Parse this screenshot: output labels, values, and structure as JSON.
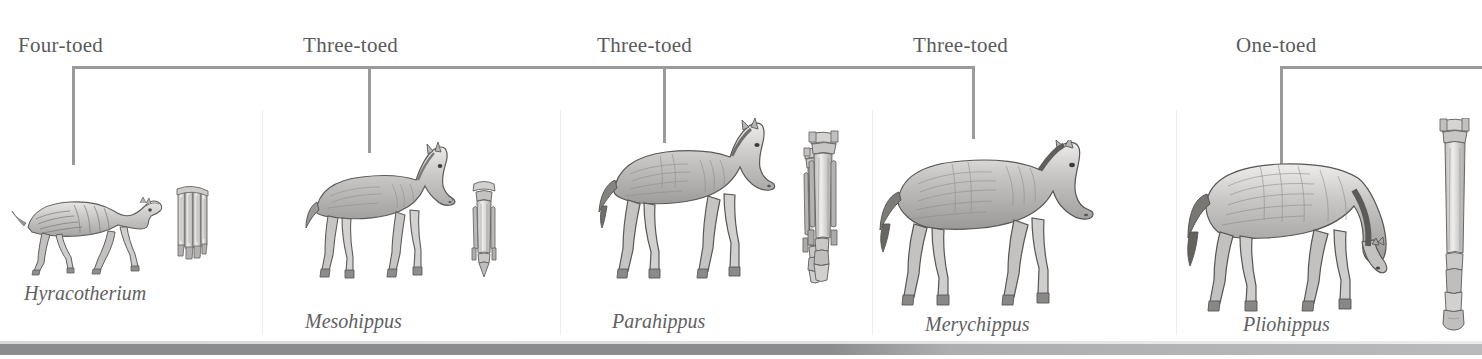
{
  "diagram": {
    "title_alt": "Horse evolution series",
    "background_color": "#ffffff",
    "rule_color": "#9a9a9c",
    "label_color": "#595a5c",
    "name_color": "#606062"
  },
  "toe_labels": [
    {
      "text": "Four-toed",
      "x": 18,
      "y": 33
    },
    {
      "text": "Three-toed",
      "x": 303,
      "y": 33
    },
    {
      "text": "Three-toed",
      "x": 597,
      "y": 33
    },
    {
      "text": "Three-toed",
      "x": 913,
      "y": 33
    },
    {
      "text": "One-toed",
      "x": 1236,
      "y": 33
    }
  ],
  "brackets": [
    {
      "name": "four-toed-bracket",
      "x": 72,
      "width": 903,
      "tick_x": [
        72,
        368,
        663,
        975
      ],
      "tick_bottom": [
        165,
        153,
        143,
        139
      ]
    },
    {
      "name": "one-toed-bracket",
      "x": 1280,
      "width": 202,
      "tick_x": [
        1280
      ],
      "tick_bottom": [
        168
      ]
    }
  ],
  "bracket_rule_y": 66,
  "panel_dividers": [
    262,
    560,
    872,
    1176
  ],
  "species": [
    {
      "name": "Hyracotherium",
      "label_x": 24,
      "label_y": 282,
      "toes": "Four-toed"
    },
    {
      "name": "Mesohippus",
      "label_x": 305,
      "label_y": 315,
      "toes": "Three-toed"
    },
    {
      "name": "Parahippus",
      "label_x": 612,
      "label_y": 315,
      "toes": "Three-toed"
    },
    {
      "name": "Merychippus",
      "label_x": 925,
      "label_y": 318,
      "toes": "Three-toed"
    },
    {
      "name": "Pliohippus",
      "label_x": 1243,
      "label_y": 318,
      "toes": "One-toed"
    }
  ],
  "timeline": {
    "bar_color_left": "#8b8c8e",
    "bar_color_right": "#b9babc"
  }
}
